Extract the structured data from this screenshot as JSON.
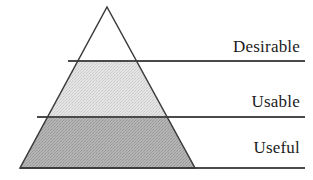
{
  "diagram": {
    "type": "pyramid",
    "title": "",
    "canvas": {
      "width": 313,
      "height": 180,
      "background": "#ffffff"
    },
    "colors": {
      "stroke": "#3a3a3a",
      "rule": "#4a4a4a",
      "tier_top_fill": "#ffffff",
      "tier_middle_fill": "#dcdcdc",
      "tier_bottom_fill": "#adadad",
      "label_text": "#1b1b1b"
    },
    "geometry": {
      "apex_x": 107,
      "apex_y": 7,
      "base_left_x": 20,
      "base_right_x": 195,
      "base_y": 168,
      "divider1_y": 61,
      "divider2_y": 117,
      "rule_right_x": 305
    },
    "tiers": [
      {
        "id": "desirable",
        "label": "Desirable",
        "level": 1,
        "fill": "#ffffff",
        "position": "top"
      },
      {
        "id": "usable",
        "label": "Usable",
        "level": 2,
        "fill": "#dcdcdc",
        "position": "middle"
      },
      {
        "id": "useful",
        "label": "Useful",
        "level": 3,
        "fill": "#adadad",
        "position": "bottom"
      }
    ]
  }
}
